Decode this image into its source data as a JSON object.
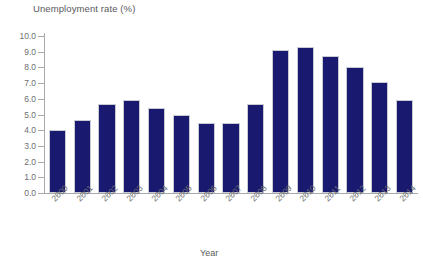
{
  "chart_data": {
    "type": "bar",
    "title": "",
    "ylabel": "Unemployment rate (%)",
    "xlabel": "Year",
    "categories": [
      "2000",
      "2001",
      "2002",
      "2003",
      "2004",
      "2005",
      "2006",
      "2007",
      "2008",
      "2009",
      "2010",
      "2011",
      "2012",
      "2013",
      "2014"
    ],
    "values": [
      4.0,
      4.65,
      5.7,
      5.9,
      5.4,
      5.0,
      4.45,
      4.45,
      5.65,
      9.1,
      9.3,
      8.75,
      8.05,
      7.1,
      5.95
    ],
    "ylim": [
      0.0,
      10.0
    ],
    "ytick_labels": [
      "10.0",
      "9.0",
      "8.0",
      "7.0",
      "6.0",
      "5.0",
      "4.0",
      "3.0",
      "2.0",
      "1.0",
      "0.0"
    ],
    "ytick_values": [
      10.0,
      9.0,
      8.0,
      7.0,
      6.0,
      5.0,
      4.0,
      3.0,
      2.0,
      1.0,
      0.0
    ],
    "grid": false,
    "legend": null,
    "bar_color": "#191970",
    "axis_color": "#a7a9ac",
    "text_color": "#6d6e71"
  }
}
